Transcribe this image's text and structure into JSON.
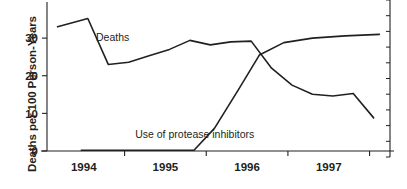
{
  "chart_data": {
    "type": "line",
    "title": "",
    "xlabel": "",
    "ylabel": "Deaths per 100 Person-Years",
    "ylim": [
      0,
      38
    ],
    "xlim": [
      1993.55,
      1997.75
    ],
    "yticks": [
      0,
      10,
      20,
      30
    ],
    "ytick_labels": [
      "0",
      "10",
      "20",
      "30"
    ],
    "xticks": [
      1994.5,
      1995.5,
      1996.5,
      1997.5
    ],
    "xtick_labels": [
      "",
      "",
      "",
      ""
    ],
    "xcategory_labels": [
      "1994",
      "1995",
      "1996",
      "1997"
    ],
    "xcategory_centers": [
      1994.0,
      1995.0,
      1996.0,
      1997.0
    ],
    "grid": false,
    "legend": "inline-annotations",
    "right_axis": {
      "present": true,
      "ticks": 11,
      "labels": []
    },
    "series": [
      {
        "name": "Deaths",
        "annotation": "Deaths",
        "annotation_x": 1994.15,
        "annotation_y": 29.3,
        "x": [
          1993.68,
          1994.05,
          1994.3,
          1994.55,
          1994.8,
          1995.05,
          1995.3,
          1995.55,
          1995.8,
          1996.05,
          1996.3,
          1996.55,
          1996.8,
          1997.05,
          1997.3,
          1997.55
        ],
        "y": [
          33.0,
          35.2,
          23.0,
          23.6,
          25.3,
          27.0,
          29.4,
          28.2,
          29.0,
          29.2,
          22.0,
          17.5,
          15.1,
          14.6,
          15.3,
          8.8
        ]
      },
      {
        "name": "Use of protease inhibitors",
        "annotation": "Use of protease inhibitors",
        "annotation_x": 1994.63,
        "annotation_y": 3.4,
        "x": [
          1993.97,
          1995.35,
          1995.6,
          1995.9,
          1996.15,
          1996.45,
          1996.8,
          1997.2,
          1997.62
        ],
        "y": [
          0.2,
          0.2,
          6.0,
          16.5,
          25.5,
          28.8,
          30.0,
          30.6,
          31.0
        ]
      }
    ]
  },
  "axis": {
    "y_title": "Deaths per 100 Person-Years"
  }
}
